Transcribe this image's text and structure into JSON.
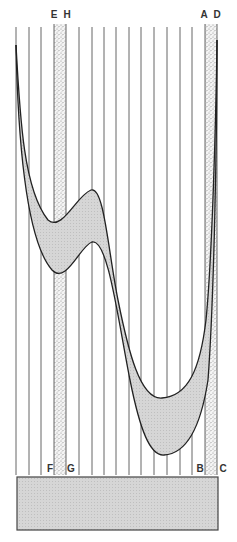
{
  "diagram": {
    "width": 237,
    "height": 542,
    "colors": {
      "line": "#555555",
      "curve": "#222222",
      "band_fill": "#cfcfcf",
      "stipple_bg": "#f4f4f4",
      "stipple_dot": "#8a8a8a",
      "box_fill": "#d4d4d4",
      "box_stroke": "#444444"
    },
    "vertical_lines": {
      "x": [
        16,
        29,
        41,
        79,
        92,
        104,
        116,
        129,
        141,
        154,
        167,
        180,
        192
      ],
      "top": 27,
      "bottom": 475
    },
    "stippled_bands": [
      {
        "name": "EH-band",
        "x1": 54,
        "x2": 66,
        "top": 24,
        "bottom": 475
      },
      {
        "name": "AD-band",
        "x1": 205,
        "x2": 217,
        "top": 24,
        "bottom": 475
      }
    ],
    "labels": {
      "top": [
        {
          "text": "E",
          "x": 54
        },
        {
          "text": "H",
          "x": 67
        },
        {
          "text": "A",
          "x": 204
        },
        {
          "text": "D",
          "x": 217
        }
      ],
      "bottom": [
        {
          "text": "F",
          "x": 50
        },
        {
          "text": "G",
          "x": 71
        },
        {
          "text": "B",
          "x": 200
        },
        {
          "text": "C",
          "x": 223
        }
      ],
      "top_y": 18,
      "bottom_y": 472
    },
    "band": {
      "upper_curve": "M16,45 C20,120 24,190 48,220 C62,232 76,196 91,190 C104,186 108,250 118,300 C128,350 140,400 162,398 C188,396 200,370 206,320 C212,260 216,120 217,40",
      "lower_curve": "M16,45 C18,140 26,240 52,270 C66,285 80,246 92,242 C108,238 118,320 130,380 C140,430 150,456 164,455 C184,454 200,432 208,380 C214,300 217,140 217,40",
      "fill_path": "M16,45 C20,120 24,190 48,220 C62,232 76,196 91,190 C104,186 108,250 118,300 C128,350 140,400 162,398 C188,396 200,370 206,320 C212,260 216,120 217,40 C217,140 214,300 208,380 C200,432 184,454 164,455 C150,456 140,430 130,380 C118,320 108,238 92,242 C80,246 66,285 52,270 C26,240 18,140 16,45 Z"
    },
    "base_box": {
      "x": 17,
      "y": 477,
      "width": 201,
      "height": 53
    }
  }
}
